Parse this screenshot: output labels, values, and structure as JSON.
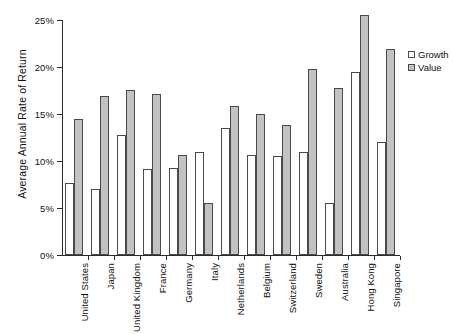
{
  "chart_data": {
    "type": "bar",
    "title": "",
    "xlabel": "",
    "ylabel": "Average Annual Rate of Return",
    "ylim": [
      0,
      25
    ],
    "ytick_values": [
      0,
      5,
      10,
      15,
      20,
      25
    ],
    "ytick_labels": [
      "0%",
      "5%",
      "10%",
      "15%",
      "20%",
      "25%"
    ],
    "grid": false,
    "legend_position": "right",
    "categories": [
      "United States",
      "Japan",
      "United Kingdom",
      "France",
      "Germany",
      "Italy",
      "Netherlands",
      "Belgium",
      "Switzerland",
      "Sweden",
      "Australia",
      "Hong Kong",
      "Singapore"
    ],
    "series": [
      {
        "name": "Growth",
        "color": "#ffffff",
        "values": [
          7.7,
          7.0,
          12.8,
          9.2,
          9.3,
          11.0,
          13.5,
          10.6,
          10.5,
          11.0,
          5.5,
          19.5,
          12.0
        ]
      },
      {
        "name": "Value",
        "color": "#c2c2c2",
        "values": [
          14.5,
          16.9,
          17.6,
          17.1,
          10.6,
          5.5,
          15.9,
          15.0,
          13.8,
          19.8,
          17.8,
          25.5,
          21.9
        ]
      }
    ]
  },
  "legend": {
    "items": [
      {
        "label": "Growth",
        "swatch": "growth"
      },
      {
        "label": "Value",
        "swatch": "value"
      }
    ]
  }
}
